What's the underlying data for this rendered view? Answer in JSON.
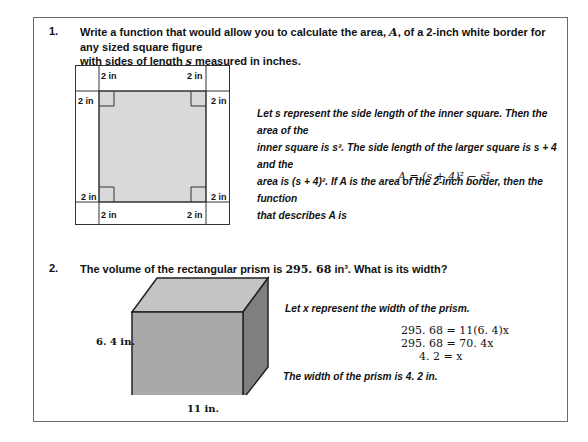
{
  "problem1": {
    "number": "1.",
    "question_line1_a": "Write a function that would allow you to calculate the area, ",
    "question_var_A": "A",
    "question_line1_b": ", of a 2-inch white border for any sized square figure",
    "question_line2_a": "with sides of length ",
    "question_var_s": "s",
    "question_line2_b": " measured in inches.",
    "diagram_labels": [
      "2 in",
      "2 in",
      "2 in",
      "2 in",
      "2 in",
      "2 in",
      "2 in",
      "2 in"
    ],
    "solution_lines": [
      "Let s represent the side length of the inner square.  Then the area of the",
      "inner square is s².  The side length of the larger square is s + 4 and the",
      "area is (s + 4)².  If A is the area of the 2-inch border, then the function",
      "that describes A is"
    ],
    "formula": "A = (s + 4)² − s²"
  },
  "problem2": {
    "number": "2.",
    "question_a": "The volume of the rectangular prism is ",
    "question_value": "295. 68",
    "question_unit": " in³",
    "question_b": ".  What is its width?",
    "height_label": "6. 4 in.",
    "length_label": "11 in.",
    "solution_intro": "Let x represent the width of the prism.",
    "equations": [
      "295. 68 = 11(6. 4)x",
      "295. 68 = 70. 4x",
      "4. 2 = x"
    ],
    "conclusion": "The width of the prism is 4. 2 in."
  },
  "colors": {
    "inner_square": "#d9d9d9",
    "prism_front": "#a9a9a9",
    "prism_top": "#c4c4c4",
    "prism_side": "#7f7f7f"
  }
}
